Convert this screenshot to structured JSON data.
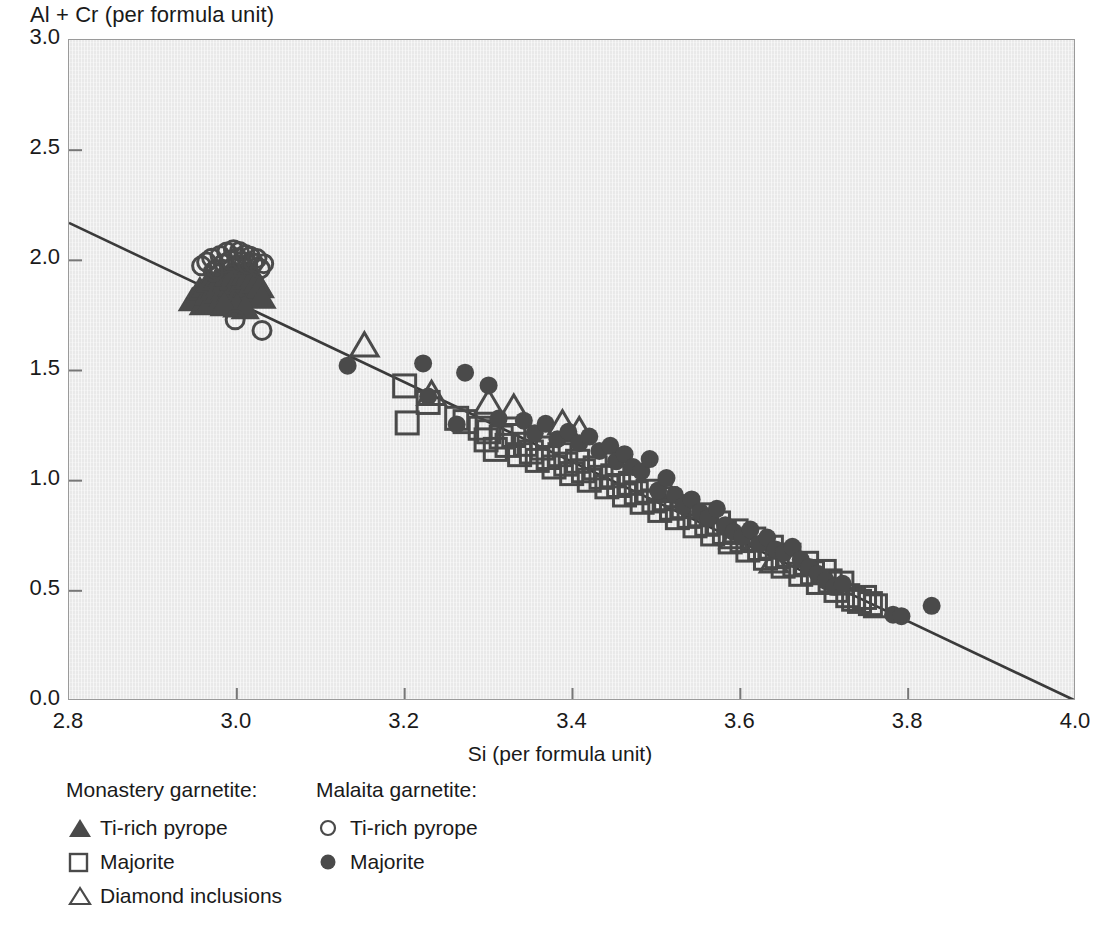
{
  "chart_data": {
    "type": "scatter",
    "title": "",
    "xlabel": "Si (per formula unit)",
    "ylabel": "Al + Cr (per formula unit)",
    "xlim": [
      2.8,
      4.0
    ],
    "ylim": [
      0.0,
      3.0
    ],
    "xticks": [
      "2.8",
      "3.0",
      "3.2",
      "3.4",
      "3.6",
      "3.8",
      "4.0"
    ],
    "yticks": [
      "0.0",
      "0.5",
      "1.0",
      "1.5",
      "2.0",
      "2.5",
      "3.0"
    ],
    "grid": false,
    "legend_position": "below-axes",
    "trendline": {
      "name": "ideal substitution line",
      "x0": 2.8,
      "y0": 2.17,
      "x1": 4.0,
      "y1": 0.0,
      "slope": -1.808,
      "intercept": 7.233
    },
    "series": [
      {
        "name": "Monastery garnetite: Ti-rich pyrope",
        "group": "Monastery garnetite",
        "label": "Ti-rich pyrope",
        "marker": "filled-triangle",
        "color": "#4a4a4a",
        "points": [
          [
            2.947,
            1.818
          ],
          [
            2.952,
            1.842
          ],
          [
            2.956,
            1.866
          ],
          [
            2.96,
            1.8
          ],
          [
            2.963,
            1.88
          ],
          [
            2.966,
            1.846
          ],
          [
            2.969,
            1.902
          ],
          [
            2.971,
            1.826
          ],
          [
            2.974,
            1.874
          ],
          [
            2.976,
            1.912
          ],
          [
            2.978,
            1.852
          ],
          [
            2.98,
            1.888
          ],
          [
            2.982,
            1.924
          ],
          [
            2.984,
            1.838
          ],
          [
            2.986,
            1.87
          ],
          [
            2.988,
            1.906
          ],
          [
            2.99,
            1.932
          ],
          [
            2.992,
            1.856
          ],
          [
            2.994,
            1.884
          ],
          [
            2.996,
            1.914
          ],
          [
            2.998,
            1.94
          ],
          [
            3.0,
            1.862
          ],
          [
            3.002,
            1.896
          ],
          [
            3.004,
            1.926
          ],
          [
            3.006,
            1.874
          ],
          [
            3.008,
            1.908
          ],
          [
            3.01,
            1.936
          ],
          [
            3.012,
            1.882
          ],
          [
            3.014,
            1.918
          ],
          [
            3.016,
            1.944
          ],
          [
            3.018,
            1.89
          ],
          [
            3.02,
            1.922
          ],
          [
            3.022,
            1.868
          ],
          [
            3.024,
            1.9
          ],
          [
            3.026,
            1.846
          ],
          [
            3.028,
            1.878
          ],
          [
            3.03,
            1.83
          ],
          [
            3.0,
            1.79
          ],
          [
            3.01,
            1.782
          ],
          [
            2.985,
            1.796
          ]
        ]
      },
      {
        "name": "Monastery garnetite: Majorite",
        "group": "Monastery garnetite",
        "label": "Majorite",
        "marker": "open-square",
        "color": "#4a4a4a",
        "points": [
          [
            3.2,
            1.43
          ],
          [
            3.203,
            1.262
          ],
          [
            3.228,
            1.355
          ],
          [
            3.262,
            1.283
          ],
          [
            3.272,
            1.268
          ],
          [
            3.29,
            1.238
          ],
          [
            3.297,
            1.185
          ],
          [
            3.3,
            1.222
          ],
          [
            3.308,
            1.142
          ],
          [
            3.315,
            1.198
          ],
          [
            3.322,
            1.16
          ],
          [
            3.33,
            1.205
          ],
          [
            3.337,
            1.118
          ],
          [
            3.344,
            1.165
          ],
          [
            3.351,
            1.13
          ],
          [
            3.358,
            1.092
          ],
          [
            3.364,
            1.148
          ],
          [
            3.371,
            1.105
          ],
          [
            3.378,
            1.062
          ],
          [
            3.385,
            1.118
          ],
          [
            3.392,
            1.075
          ],
          [
            3.399,
            1.032
          ],
          [
            3.406,
            1.088
          ],
          [
            3.413,
            1.045
          ],
          [
            3.42,
            1.002
          ],
          [
            3.427,
            1.058
          ],
          [
            3.434,
            1.015
          ],
          [
            3.441,
            0.972
          ],
          [
            3.448,
            1.022
          ],
          [
            3.455,
            0.978
          ],
          [
            3.462,
            0.935
          ],
          [
            3.469,
            0.988
          ],
          [
            3.476,
            0.945
          ],
          [
            3.483,
            0.902
          ],
          [
            3.49,
            0.952
          ],
          [
            3.497,
            0.908
          ],
          [
            3.504,
            0.865
          ],
          [
            3.511,
            0.918
          ],
          [
            3.518,
            0.875
          ],
          [
            3.525,
            0.832
          ],
          [
            3.532,
            0.882
          ],
          [
            3.539,
            0.838
          ],
          [
            3.546,
            0.795
          ],
          [
            3.553,
            0.845
          ],
          [
            3.56,
            0.802
          ],
          [
            3.567,
            0.758
          ],
          [
            3.574,
            0.808
          ],
          [
            3.581,
            0.765
          ],
          [
            3.588,
            0.722
          ],
          [
            3.595,
            0.772
          ],
          [
            3.602,
            0.728
          ],
          [
            3.609,
            0.685
          ],
          [
            3.616,
            0.735
          ],
          [
            3.623,
            0.692
          ],
          [
            3.63,
            0.648
          ],
          [
            3.637,
            0.698
          ],
          [
            3.644,
            0.655
          ],
          [
            3.651,
            0.612
          ],
          [
            3.658,
            0.662
          ],
          [
            3.665,
            0.618
          ],
          [
            3.672,
            0.575
          ],
          [
            3.679,
            0.625
          ],
          [
            3.686,
            0.582
          ],
          [
            3.693,
            0.538
          ],
          [
            3.7,
            0.588
          ],
          [
            3.707,
            0.545
          ],
          [
            3.714,
            0.502
          ],
          [
            3.721,
            0.535
          ],
          [
            3.728,
            0.478
          ],
          [
            3.735,
            0.462
          ],
          [
            3.742,
            0.452
          ],
          [
            3.748,
            0.47
          ],
          [
            3.755,
            0.442
          ],
          [
            3.761,
            0.432
          ]
        ]
      },
      {
        "name": "Monastery garnetite: Diamond inclusions",
        "group": "Monastery garnetite",
        "label": "Diamond inclusions",
        "marker": "open-triangle",
        "color": "#4a4a4a",
        "points": [
          [
            3.152,
            1.612
          ],
          [
            3.232,
            1.392
          ],
          [
            3.3,
            1.352
          ],
          [
            3.33,
            1.33
          ],
          [
            3.388,
            1.258
          ],
          [
            3.408,
            1.228
          ],
          [
            3.512,
            0.952
          ],
          [
            3.592,
            0.742
          ],
          [
            3.64,
            0.632
          ]
        ]
      },
      {
        "name": "Malaita garnetite: Ti-rich pyrope",
        "group": "Malaita garnetite",
        "label": "Ti-rich pyrope",
        "marker": "open-circle",
        "color": "#4a4a4a",
        "points": [
          [
            2.958,
            1.975
          ],
          [
            2.964,
            1.992
          ],
          [
            2.97,
            2.01
          ],
          [
            2.975,
            1.96
          ],
          [
            2.98,
            2.022
          ],
          [
            2.984,
            1.985
          ],
          [
            2.988,
            2.038
          ],
          [
            2.992,
            2.0
          ],
          [
            2.996,
            2.048
          ],
          [
            3.0,
            2.012
          ],
          [
            3.003,
            2.04
          ],
          [
            3.006,
            1.996
          ],
          [
            3.01,
            2.026
          ],
          [
            3.013,
            1.982
          ],
          [
            3.016,
            2.018
          ],
          [
            3.02,
            1.988
          ],
          [
            3.024,
            2.008
          ],
          [
            3.028,
            1.962
          ],
          [
            3.032,
            1.985
          ],
          [
            2.972,
            1.948
          ],
          [
            2.998,
            1.73
          ],
          [
            3.03,
            1.682
          ]
        ]
      },
      {
        "name": "Malaita garnetite: Majorite",
        "group": "Malaita garnetite",
        "label": "Majorite",
        "marker": "filled-circle",
        "color": "#4a4a4a",
        "points": [
          [
            3.132,
            1.522
          ],
          [
            3.222,
            1.532
          ],
          [
            3.228,
            1.382
          ],
          [
            3.272,
            1.49
          ],
          [
            3.262,
            1.255
          ],
          [
            3.3,
            1.432
          ],
          [
            3.312,
            1.282
          ],
          [
            3.342,
            1.272
          ],
          [
            3.355,
            1.215
          ],
          [
            3.368,
            1.258
          ],
          [
            3.382,
            1.188
          ],
          [
            3.395,
            1.222
          ],
          [
            3.408,
            1.17
          ],
          [
            3.42,
            1.2
          ],
          [
            3.432,
            1.135
          ],
          [
            3.445,
            1.158
          ],
          [
            3.452,
            1.088
          ],
          [
            3.462,
            1.12
          ],
          [
            3.472,
            1.062
          ],
          [
            3.482,
            1.042
          ],
          [
            3.492,
            1.098
          ],
          [
            3.502,
            0.955
          ],
          [
            3.512,
            1.012
          ],
          [
            3.522,
            0.935
          ],
          [
            3.532,
            0.885
          ],
          [
            3.542,
            0.915
          ],
          [
            3.552,
            0.858
          ],
          [
            3.562,
            0.832
          ],
          [
            3.572,
            0.872
          ],
          [
            3.582,
            0.798
          ],
          [
            3.592,
            0.768
          ],
          [
            3.602,
            0.745
          ],
          [
            3.612,
            0.778
          ],
          [
            3.622,
            0.712
          ],
          [
            3.632,
            0.742
          ],
          [
            3.642,
            0.688
          ],
          [
            3.652,
            0.672
          ],
          [
            3.662,
            0.7
          ],
          [
            3.672,
            0.642
          ],
          [
            3.682,
            0.608
          ],
          [
            3.692,
            0.578
          ],
          [
            3.702,
            0.545
          ],
          [
            3.712,
            0.518
          ],
          [
            3.722,
            0.532
          ],
          [
            3.782,
            0.392
          ],
          [
            3.792,
            0.385
          ],
          [
            3.828,
            0.432
          ]
        ]
      }
    ]
  },
  "legend": {
    "columns": [
      {
        "heading": "Monastery garnetite:",
        "entries": [
          {
            "marker": "filled-triangle",
            "label": "Ti-rich pyrope"
          },
          {
            "marker": "open-square",
            "label": "Majorite"
          },
          {
            "marker": "open-triangle",
            "label": "Diamond inclusions"
          }
        ]
      },
      {
        "heading": "Malaita garnetite:",
        "entries": [
          {
            "marker": "open-circle",
            "label": "Ti-rich pyrope"
          },
          {
            "marker": "filled-circle",
            "label": "Majorite"
          }
        ]
      }
    ]
  },
  "colors": {
    "marker": "#4a4a4a",
    "plot_background": "#e9e9e9",
    "frame": "#9a9a9a",
    "trendline": "#3a3a3a",
    "text": "#1a1a1a",
    "page_background": "#ffffff"
  }
}
